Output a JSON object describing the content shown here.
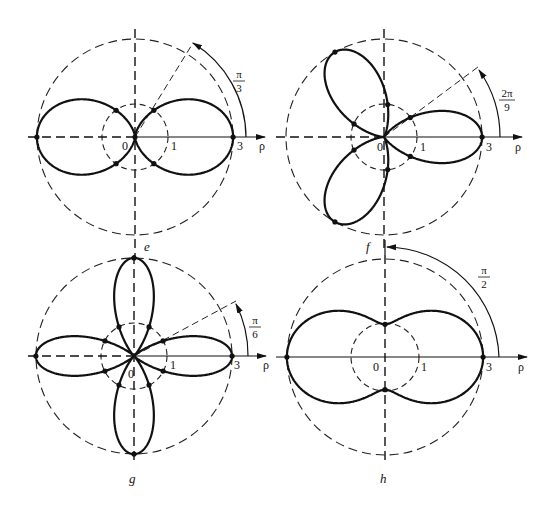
{
  "figure": {
    "panels": [
      {
        "id": "e",
        "label": "e",
        "angle_num": "π",
        "angle_den": "3",
        "origin_label": "0",
        "tick_one": "1",
        "tick_three": "3",
        "axis_label": "ρ"
      },
      {
        "id": "f",
        "label": "f",
        "angle_num": "2π",
        "angle_den": "9",
        "origin_label": "0",
        "tick_one": "1",
        "tick_three": "3",
        "axis_label": "ρ"
      },
      {
        "id": "g",
        "label": "g",
        "angle_num": "π",
        "angle_den": "6",
        "origin_label": "0",
        "tick_one": "1",
        "tick_three": "3",
        "axis_label": "ρ"
      },
      {
        "id": "h",
        "label": "h",
        "angle_num": "π",
        "angle_den": "2",
        "origin_label": "0",
        "tick_one": "1",
        "tick_three": "3",
        "axis_label": "ρ"
      }
    ]
  },
  "colors": {
    "stroke": "#111111",
    "background": "#ffffff"
  }
}
